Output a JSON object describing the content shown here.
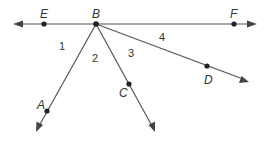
{
  "diagram": {
    "type": "rays-from-point",
    "vertex": "B",
    "points": {
      "E": "E",
      "B": "B",
      "F": "F",
      "A": "A",
      "C": "C",
      "D": "D"
    },
    "angles": {
      "a1": "1",
      "a2": "2",
      "a3": "3",
      "a4": "4"
    },
    "rays": [
      "BE",
      "BF",
      "BA",
      "BC",
      "BD"
    ]
  }
}
